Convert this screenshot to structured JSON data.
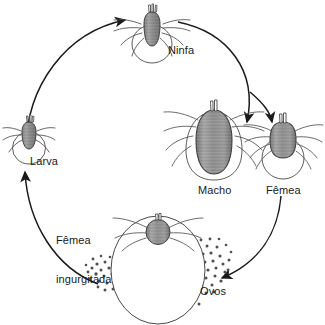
{
  "diagram": {
    "kind": "tick-life-cycle",
    "language": "pt-BR",
    "background_color": "#ffffff",
    "ink_color": "#1a1a1a",
    "body_fill_color": "#8c8c8c",
    "egg_color": "#595959",
    "labels": {
      "ninfa": "Ninfa",
      "larva": "Larva",
      "macho": "Macho",
      "femea": "Fêmea",
      "ovos": "Ovos",
      "femea_ingurgitada_line1": "Fêmea",
      "femea_ingurgitada_line2": "ingurgitada"
    },
    "stages": [
      {
        "id": "ninfa",
        "label": "Ninfa",
        "position": "top-center"
      },
      {
        "id": "larva",
        "label": "Larva",
        "position": "left"
      },
      {
        "id": "macho",
        "label": "Macho",
        "position": "right-center"
      },
      {
        "id": "femea",
        "label": "Fêmea",
        "position": "right"
      },
      {
        "id": "femea-ingurgitada",
        "label": "Fêmea ingurgitada",
        "position": "bottom-center"
      },
      {
        "id": "ovos",
        "label": "Ovos",
        "position": "bottom-right"
      }
    ],
    "arrows": [
      {
        "id": "larva-to-ninfa",
        "from": "larva",
        "to": "ninfa"
      },
      {
        "id": "ninfa-to-macho",
        "from": "ninfa",
        "to": "macho"
      },
      {
        "id": "ninfa-to-femea",
        "from": "ninfa",
        "to": "femea"
      },
      {
        "id": "femea-to-ovos",
        "from": "femea",
        "to": "ovos"
      },
      {
        "id": "ovos-to-larva",
        "from": "ovos",
        "to": "larva"
      }
    ]
  }
}
